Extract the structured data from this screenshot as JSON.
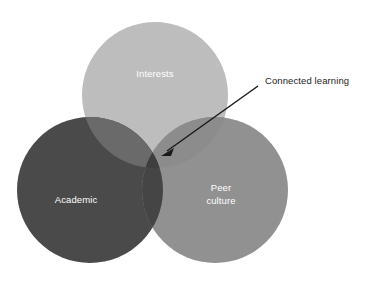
{
  "figure": {
    "type": "venn-diagram",
    "background_color": "#ffffff",
    "circle_radius": 73,
    "width": 366,
    "height": 283
  },
  "circles": [
    {
      "id": "interests",
      "label": "Interests",
      "color": "#bdbdbd",
      "cx": 155,
      "cy": 95,
      "label_x": 155,
      "label_y": 74
    },
    {
      "id": "academic",
      "label": "Academic",
      "color": "#4a4a4a",
      "cx": 90,
      "cy": 190,
      "label_x": 76,
      "label_y": 200
    },
    {
      "id": "peer-culture",
      "label": "Peer culture",
      "label_line1": "Peer",
      "label_line2": "culture",
      "color": "#919191",
      "cx": 215,
      "cy": 190,
      "label_x": 221,
      "label_y": 188
    }
  ],
  "overlaps": [
    {
      "id": "academic-interests",
      "color": "#6a6a6a"
    },
    {
      "id": "interests-peer-culture",
      "color": "#8c8c8c"
    },
    {
      "id": "academic-peer-culture",
      "color": "#454545"
    },
    {
      "id": "triple-center",
      "color": "#3e3e3e"
    }
  ],
  "annotation": {
    "label": "Connected learning",
    "text_color": "#1c1c1c",
    "text_x": 265,
    "text_y": 81,
    "arrow_start_x": 258,
    "arrow_start_y": 86,
    "arrow_end_x": 161,
    "arrow_end_y": 156,
    "arrow_color": "#1a1a1a"
  }
}
